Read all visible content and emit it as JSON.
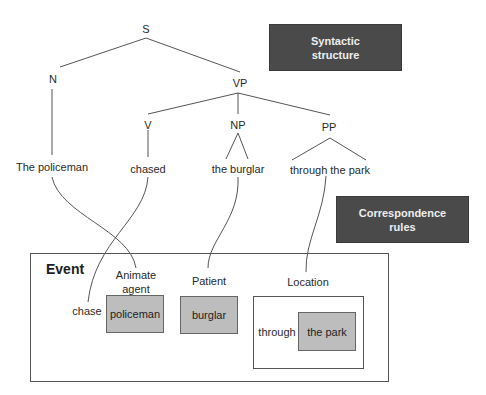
{
  "labels": {
    "syntactic_structure": "Syntactic\nstructure",
    "correspondence_rules": "Correspondence\nrules"
  },
  "tree": {
    "S": "S",
    "N": "N",
    "VP": "VP",
    "V": "V",
    "NP": "NP",
    "PP": "PP",
    "leaves": {
      "policeman": "The policeman",
      "chased": "chased",
      "burglar": "the burglar",
      "park": "through the park"
    }
  },
  "event": {
    "title": "Event",
    "animate_agent": "Animate\nagent",
    "patient": "Patient",
    "location": "Location",
    "chase": "chase",
    "policeman": "policeman",
    "burglar": "burglar",
    "through": "through",
    "the_park": "the park"
  },
  "colors": {
    "dark_box": "#4a4a4a",
    "gray_box": "#bdbdbd",
    "line": "#555555"
  }
}
